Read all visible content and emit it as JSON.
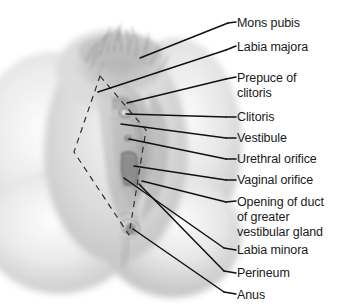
{
  "figure": {
    "type": "anatomical-illustration",
    "width": 345,
    "height": 308,
    "background_color": "#ffffff",
    "line_color": "#111111",
    "text_color": "#1a1a1a"
  },
  "labels": [
    {
      "id": "mons-pubis",
      "lines": [
        "Mons pubis"
      ],
      "text_x": 237,
      "text_y": 16,
      "tick_x1": 228,
      "tick_y1": 23,
      "tick_x2": 236,
      "tick_y2": 22,
      "leader": [
        [
          228,
          23
        ],
        [
          140,
          58
        ]
      ]
    },
    {
      "id": "labia-majora",
      "lines": [
        "Labia majora"
      ],
      "text_x": 237,
      "text_y": 40,
      "tick_x1": 226,
      "tick_y1": 50,
      "tick_x2": 236,
      "tick_y2": 46,
      "leader": [
        [
          226,
          50
        ],
        [
          98,
          92
        ]
      ]
    },
    {
      "id": "prepuce-of-clitoris",
      "lines": [
        "Prepuce of",
        "clitoris"
      ],
      "text_x": 237,
      "text_y": 71,
      "tick_x1": 226,
      "tick_y1": 79,
      "tick_x2": 236,
      "tick_y2": 77,
      "leader": [
        [
          226,
          79
        ],
        [
          127,
          103
        ]
      ]
    },
    {
      "id": "clitoris",
      "lines": [
        "Clitoris"
      ],
      "text_x": 237,
      "text_y": 110,
      "tick_x1": 226,
      "tick_y1": 117,
      "tick_x2": 236,
      "tick_y2": 117,
      "leader": [
        [
          226,
          117
        ],
        [
          126,
          114
        ]
      ]
    },
    {
      "id": "vestibule",
      "lines": [
        "Vestibule"
      ],
      "text_x": 237,
      "text_y": 131,
      "tick_x1": 226,
      "tick_y1": 138,
      "tick_x2": 236,
      "tick_y2": 138,
      "leader": [
        [
          226,
          138
        ],
        [
          121,
          124
        ]
      ]
    },
    {
      "id": "urethral-orifice",
      "lines": [
        "Urethral orifice"
      ],
      "text_x": 237,
      "text_y": 152,
      "tick_x1": 226,
      "tick_y1": 159,
      "tick_x2": 236,
      "tick_y2": 159,
      "leader": [
        [
          226,
          159
        ],
        [
          129,
          139
        ]
      ]
    },
    {
      "id": "vaginal-orifice",
      "lines": [
        "Vaginal orifice"
      ],
      "text_x": 237,
      "text_y": 173,
      "tick_x1": 226,
      "tick_y1": 180,
      "tick_x2": 236,
      "tick_y2": 180,
      "leader": [
        [
          226,
          180
        ],
        [
          134,
          166
        ]
      ]
    },
    {
      "id": "opening-of-duct-of-greater-vestibular-gland",
      "lines": [
        "Opening of duct",
        "of greater",
        "vestibular gland"
      ],
      "text_x": 237,
      "text_y": 195,
      "tick_x1": 226,
      "tick_y1": 202,
      "tick_x2": 236,
      "tick_y2": 201,
      "leader": [
        [
          226,
          202
        ],
        [
          142,
          181
        ]
      ]
    },
    {
      "id": "labia-minora",
      "lines": [
        "Labia minora"
      ],
      "text_x": 237,
      "text_y": 243,
      "tick_x1": 224,
      "tick_y1": 248,
      "tick_x2": 236,
      "tick_y2": 250,
      "leader": [
        [
          224,
          248
        ],
        [
          124,
          178
        ]
      ]
    },
    {
      "id": "perineum",
      "lines": [
        "Perineum"
      ],
      "text_x": 237,
      "text_y": 266,
      "tick_x1": 224,
      "tick_y1": 271,
      "tick_x2": 236,
      "tick_y2": 273,
      "leader": [
        [
          224,
          271
        ],
        [
          139,
          184
        ]
      ]
    },
    {
      "id": "anus",
      "lines": [
        "Anus"
      ],
      "text_x": 237,
      "text_y": 288,
      "tick_x1": 224,
      "tick_y1": 292,
      "tick_x2": 236,
      "tick_y2": 294,
      "leader": [
        [
          224,
          292
        ],
        [
          133,
          229
        ]
      ]
    }
  ],
  "dashed_boundary": {
    "name": "perineal-region-outline",
    "points": [
      [
        100,
        76
      ],
      [
        146,
        130
      ],
      [
        129,
        235
      ],
      [
        74,
        152
      ]
    ]
  }
}
